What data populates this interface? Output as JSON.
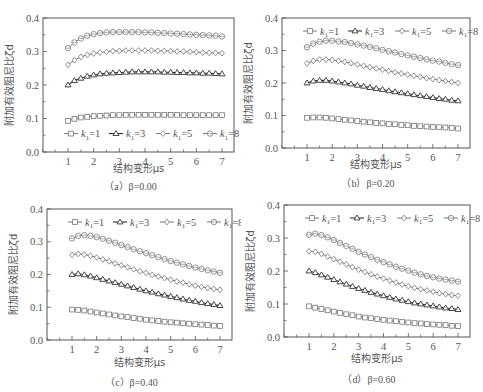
{
  "figure": {
    "ylabel": "附加有效阻尼比ζd",
    "xlabel": "结构变形μs",
    "legend": [
      "k1=1",
      "k1=3",
      "k1=5",
      "k1=8"
    ],
    "xticks": [
      "1",
      "2",
      "3",
      "4",
      "5",
      "6",
      "7"
    ],
    "yticks": [
      "0.0",
      "0.1",
      "0.2",
      "0.3",
      "0.4"
    ]
  },
  "chart_data": [
    {
      "type": "line",
      "title": "(a) β=0.00",
      "caption": "（a）β=0.00",
      "xlabel": "结构变形μs",
      "ylabel": "附加有效阻尼比ζd",
      "xlim": [
        0,
        7.5
      ],
      "ylim": [
        0,
        0.4
      ],
      "legend_position": "lower",
      "x": [
        1,
        1.25,
        1.5,
        1.75,
        2,
        2.25,
        2.5,
        2.75,
        3,
        3.25,
        3.5,
        3.75,
        4,
        4.25,
        4.5,
        4.75,
        5,
        5.25,
        5.5,
        5.75,
        6,
        6.25,
        6.5,
        6.75,
        7
      ],
      "series": [
        {
          "name": "k1=1",
          "marker": "square",
          "values": [
            0.093,
            0.099,
            0.103,
            0.105,
            0.107,
            0.108,
            0.109,
            0.11,
            0.11,
            0.111,
            0.111,
            0.111,
            0.111,
            0.111,
            0.111,
            0.111,
            0.111,
            0.111,
            0.11,
            0.11,
            0.11,
            0.11,
            0.11,
            0.11,
            0.11
          ]
        },
        {
          "name": "k1=3",
          "marker": "triangle",
          "values": [
            0.2,
            0.213,
            0.22,
            0.226,
            0.23,
            0.233,
            0.235,
            0.236,
            0.237,
            0.238,
            0.239,
            0.239,
            0.239,
            0.239,
            0.239,
            0.238,
            0.238,
            0.237,
            0.237,
            0.236,
            0.236,
            0.235,
            0.235,
            0.234,
            0.233
          ]
        },
        {
          "name": "k1=5",
          "marker": "diamond",
          "values": [
            0.26,
            0.274,
            0.284,
            0.29,
            0.294,
            0.297,
            0.299,
            0.301,
            0.302,
            0.303,
            0.303,
            0.303,
            0.303,
            0.303,
            0.302,
            0.302,
            0.301,
            0.3,
            0.3,
            0.299,
            0.298,
            0.297,
            0.296,
            0.296,
            0.295
          ]
        },
        {
          "name": "k1=8",
          "marker": "circle",
          "values": [
            0.31,
            0.327,
            0.339,
            0.347,
            0.352,
            0.355,
            0.357,
            0.358,
            0.358,
            0.358,
            0.358,
            0.358,
            0.357,
            0.357,
            0.356,
            0.355,
            0.354,
            0.353,
            0.352,
            0.351,
            0.35,
            0.349,
            0.348,
            0.347,
            0.345
          ]
        }
      ]
    },
    {
      "type": "line",
      "title": "(b) β=0.20",
      "caption": "（b）β=0.20",
      "xlabel": "结构变形μs",
      "ylabel": "附加有效阻尼比ζd",
      "xlim": [
        0,
        7.5
      ],
      "ylim": [
        0,
        0.4
      ],
      "legend_position": "upper",
      "x": [
        1,
        1.25,
        1.5,
        1.75,
        2,
        2.25,
        2.5,
        2.75,
        3,
        3.25,
        3.5,
        3.75,
        4,
        4.25,
        4.5,
        4.75,
        5,
        5.25,
        5.5,
        5.75,
        6,
        6.25,
        6.5,
        6.75,
        7
      ],
      "series": [
        {
          "name": "k1=1",
          "marker": "square",
          "values": [
            0.093,
            0.094,
            0.094,
            0.093,
            0.091,
            0.089,
            0.087,
            0.085,
            0.083,
            0.081,
            0.079,
            0.077,
            0.076,
            0.074,
            0.073,
            0.071,
            0.07,
            0.068,
            0.067,
            0.066,
            0.065,
            0.064,
            0.063,
            0.062,
            0.06
          ]
        },
        {
          "name": "k1=3",
          "marker": "triangle",
          "values": [
            0.2,
            0.206,
            0.208,
            0.208,
            0.206,
            0.203,
            0.2,
            0.197,
            0.193,
            0.19,
            0.186,
            0.183,
            0.18,
            0.176,
            0.173,
            0.17,
            0.167,
            0.164,
            0.161,
            0.158,
            0.155,
            0.152,
            0.15,
            0.147,
            0.145
          ]
        },
        {
          "name": "k1=5",
          "marker": "diamond",
          "values": [
            0.26,
            0.268,
            0.272,
            0.272,
            0.271,
            0.268,
            0.265,
            0.261,
            0.257,
            0.253,
            0.249,
            0.245,
            0.241,
            0.237,
            0.233,
            0.229,
            0.226,
            0.222,
            0.219,
            0.215,
            0.212,
            0.209,
            0.206,
            0.203,
            0.2
          ]
        },
        {
          "name": "k1=8",
          "marker": "circle",
          "values": [
            0.31,
            0.321,
            0.327,
            0.33,
            0.33,
            0.328,
            0.326,
            0.323,
            0.319,
            0.315,
            0.311,
            0.307,
            0.302,
            0.298,
            0.294,
            0.289,
            0.285,
            0.281,
            0.277,
            0.273,
            0.269,
            0.266,
            0.262,
            0.258,
            0.255
          ]
        }
      ]
    },
    {
      "type": "line",
      "title": "(c) β=0.40",
      "caption": "（c）β=0.40",
      "xlabel": "结构变形μs",
      "ylabel": "附加有效阻尼比ζd",
      "xlim": [
        0,
        7.5
      ],
      "ylim": [
        0,
        0.4
      ],
      "legend_position": "upper",
      "x": [
        1,
        1.25,
        1.5,
        1.75,
        2,
        2.25,
        2.5,
        2.75,
        3,
        3.25,
        3.5,
        3.75,
        4,
        4.25,
        4.5,
        4.75,
        5,
        5.25,
        5.5,
        5.75,
        6,
        6.25,
        6.5,
        6.75,
        7
      ],
      "series": [
        {
          "name": "k1=1",
          "marker": "square",
          "values": [
            0.093,
            0.092,
            0.09,
            0.087,
            0.084,
            0.081,
            0.078,
            0.075,
            0.072,
            0.07,
            0.067,
            0.065,
            0.062,
            0.06,
            0.058,
            0.056,
            0.054,
            0.053,
            0.051,
            0.05,
            0.048,
            0.047,
            0.046,
            0.044,
            0.043
          ]
        },
        {
          "name": "k1=3",
          "marker": "triangle",
          "values": [
            0.2,
            0.202,
            0.199,
            0.195,
            0.19,
            0.185,
            0.18,
            0.175,
            0.17,
            0.165,
            0.16,
            0.155,
            0.15,
            0.146,
            0.141,
            0.137,
            0.133,
            0.129,
            0.125,
            0.121,
            0.118,
            0.114,
            0.111,
            0.108,
            0.105
          ]
        },
        {
          "name": "k1=5",
          "marker": "diamond",
          "values": [
            0.26,
            0.263,
            0.261,
            0.257,
            0.252,
            0.246,
            0.24,
            0.234,
            0.228,
            0.222,
            0.216,
            0.21,
            0.205,
            0.199,
            0.194,
            0.189,
            0.184,
            0.179,
            0.175,
            0.17,
            0.166,
            0.162,
            0.159,
            0.156,
            0.153
          ]
        },
        {
          "name": "k1=8",
          "marker": "circle",
          "values": [
            0.31,
            0.318,
            0.32,
            0.318,
            0.314,
            0.309,
            0.303,
            0.297,
            0.29,
            0.284,
            0.277,
            0.271,
            0.265,
            0.259,
            0.253,
            0.247,
            0.241,
            0.236,
            0.231,
            0.226,
            0.221,
            0.217,
            0.213,
            0.209,
            0.205
          ]
        }
      ]
    },
    {
      "type": "line",
      "title": "(d) β=0.60",
      "caption": "（d）β=0.60",
      "xlabel": "结构变形μs",
      "ylabel": "附加有效阻尼比ζd",
      "xlim": [
        0,
        7.5
      ],
      "ylim": [
        0,
        0.4
      ],
      "legend_position": "upper",
      "x": [
        1,
        1.25,
        1.5,
        1.75,
        2,
        2.25,
        2.5,
        2.75,
        3,
        3.25,
        3.5,
        3.75,
        4,
        4.25,
        4.5,
        4.75,
        5,
        5.25,
        5.5,
        5.75,
        6,
        6.25,
        6.5,
        6.75,
        7
      ],
      "series": [
        {
          "name": "k1=1",
          "marker": "square",
          "values": [
            0.093,
            0.089,
            0.085,
            0.081,
            0.077,
            0.073,
            0.069,
            0.066,
            0.062,
            0.059,
            0.057,
            0.054,
            0.052,
            0.05,
            0.048,
            0.046,
            0.044,
            0.042,
            0.041,
            0.039,
            0.038,
            0.037,
            0.036,
            0.034,
            0.033
          ]
        },
        {
          "name": "k1=3",
          "marker": "triangle",
          "values": [
            0.2,
            0.195,
            0.188,
            0.181,
            0.174,
            0.167,
            0.16,
            0.153,
            0.147,
            0.141,
            0.135,
            0.13,
            0.125,
            0.12,
            0.115,
            0.111,
            0.107,
            0.103,
            0.1,
            0.097,
            0.094,
            0.091,
            0.088,
            0.086,
            0.083
          ]
        },
        {
          "name": "k1=5",
          "marker": "diamond",
          "values": [
            0.26,
            0.258,
            0.252,
            0.244,
            0.236,
            0.228,
            0.22,
            0.212,
            0.204,
            0.197,
            0.19,
            0.183,
            0.177,
            0.171,
            0.165,
            0.159,
            0.154,
            0.149,
            0.145,
            0.141,
            0.137,
            0.133,
            0.13,
            0.127,
            0.125
          ]
        },
        {
          "name": "k1=8",
          "marker": "circle",
          "values": [
            0.31,
            0.313,
            0.309,
            0.302,
            0.294,
            0.285,
            0.276,
            0.267,
            0.258,
            0.25,
            0.242,
            0.234,
            0.227,
            0.22,
            0.213,
            0.207,
            0.201,
            0.195,
            0.19,
            0.185,
            0.181,
            0.177,
            0.174,
            0.171,
            0.168
          ]
        }
      ]
    }
  ],
  "legend_labels": {
    "k1": "k",
    "sub": "1",
    "values": [
      "=1",
      "=3",
      "=5",
      "=8"
    ]
  },
  "colors": {
    "line": "#555555",
    "marker_stroke": "#777777",
    "triangle_line": "#333333",
    "axis": "#555555"
  }
}
